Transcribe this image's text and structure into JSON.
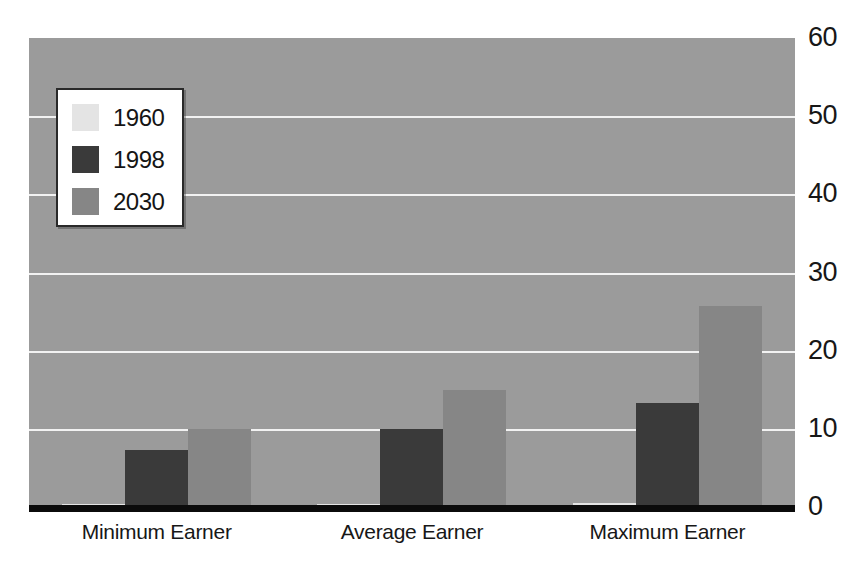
{
  "chart_data": {
    "type": "bar",
    "title": "",
    "subtitle": "",
    "xlabel": "",
    "ylabel": "",
    "categories": [
      "Minimum Earner",
      "Average Earner",
      "Maximum Earner"
    ],
    "series": [
      {
        "name": "1960",
        "color": "#e4e4e4",
        "values": [
          0.3,
          0.4,
          0.5
        ]
      },
      {
        "name": "1998",
        "color": "#3a3a3a",
        "values": [
          7.3,
          10.0,
          13.3
        ]
      },
      {
        "name": "2030",
        "color": "#868686",
        "values": [
          10.0,
          15.0,
          25.7
        ]
      }
    ],
    "ylim": [
      0,
      60
    ],
    "yticks": [
      0,
      10,
      20,
      30,
      40,
      50,
      60
    ],
    "ytick_labels": [
      "0",
      "10",
      "20",
      "30",
      "40",
      "50",
      "60"
    ],
    "grid": true,
    "grid_color": "#f2f2f2",
    "legend_position": "upper-left",
    "plot_background": "#9b9b9b",
    "figure_background": "#ffffff",
    "axis_color": "#0b0b0b",
    "tick_label_position": "right"
  },
  "legend": {
    "entries": [
      {
        "label": "1960",
        "color": "#e4e4e4"
      },
      {
        "label": "1998",
        "color": "#3a3a3a"
      },
      {
        "label": "2030",
        "color": "#868686"
      }
    ]
  },
  "axes": {
    "y_tick_labels": [
      "60",
      "50",
      "40",
      "30",
      "20",
      "10",
      "0"
    ],
    "x_tick_labels": [
      "Minimum Earner",
      "Average Earner",
      "Maximum Earner"
    ]
  }
}
